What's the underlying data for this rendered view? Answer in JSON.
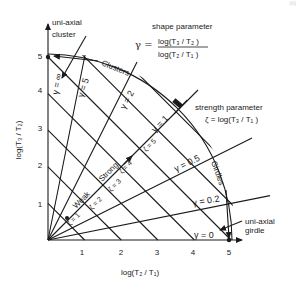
{
  "diagram": {
    "x_axis": {
      "label": "log(T₂ / T₁)",
      "ticks": [
        "1",
        "2",
        "3",
        "4",
        "5"
      ]
    },
    "y_axis": {
      "label": "log(T₃ / T₂)",
      "ticks": [
        "1",
        "2",
        "3",
        "4",
        "5"
      ]
    },
    "shape_parameter": {
      "title": "shape parameter",
      "symbol": "γ =",
      "numerator": "log(T₃ / T₂ )",
      "denominator": "log(T₂ / T₁ )"
    },
    "strength_parameter": {
      "title": "strength parameter",
      "formula": "ζ = log(T₃ / T₁ )"
    },
    "regions": {
      "clusters": "Clusters",
      "girdles": "Girdles"
    },
    "annotations": {
      "uniaxial_cluster_line1": "uni-axial",
      "uniaxial_cluster_line2": "cluster",
      "uniaxial_girdle_line1": "uni-axial",
      "uniaxial_girdle_line2": "girdle",
      "weak": "Weak",
      "strong": "Strong"
    },
    "gamma_labels": [
      "γ = ∞",
      "γ = 5",
      "γ = 2",
      "γ = 1",
      "γ = 0.5",
      "γ = 0.2",
      "γ = 0"
    ],
    "zeta_labels": [
      "ζ = 1",
      "ζ = 2",
      "ζ = 3",
      "ζ = 4",
      "ζ = 5"
    ],
    "zeta_values": [
      "1",
      "2",
      "3",
      "4",
      "5"
    ],
    "gamma_values": [
      0,
      0.2,
      0.5,
      1,
      2,
      5
    ],
    "page_mark": "(iii)"
  }
}
